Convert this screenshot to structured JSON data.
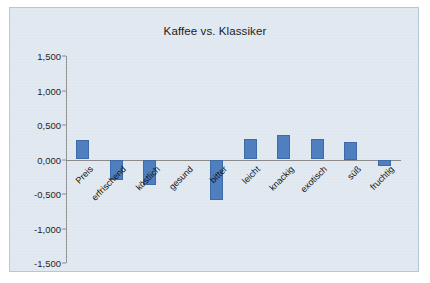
{
  "chart_data": {
    "type": "bar",
    "title": "Kaffee vs. Klassiker",
    "xlabel": "",
    "ylabel": "",
    "ylim": [
      -1.5,
      1.5
    ],
    "ytick_labels": [
      "1,500",
      "1,000",
      "0,500",
      "0,000",
      "-0,500",
      "-1,000",
      "-1,500"
    ],
    "ytick_values": [
      1.5,
      1.0,
      0.5,
      0.0,
      -0.5,
      -1.0,
      -1.5
    ],
    "grid": false,
    "legend": "none",
    "bar_color": "#4f7fbf",
    "plot_background": "#dfe7f0",
    "categories": [
      "Preis",
      "erfrischend",
      "köstlich",
      "gesund",
      "bitter",
      "leicht",
      "knackig",
      "exotisch",
      "süß",
      "fruchtig"
    ],
    "values": [
      0.28,
      -0.29,
      -0.37,
      0.0,
      -0.58,
      0.3,
      0.35,
      0.29,
      0.25,
      -0.1
    ]
  }
}
